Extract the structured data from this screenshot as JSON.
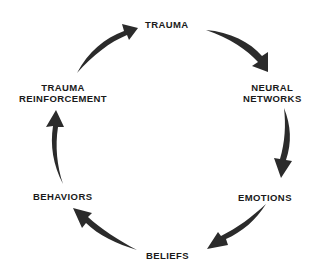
{
  "diagram": {
    "type": "cycle",
    "direction": "clockwise",
    "nodes": [
      {
        "id": "trauma",
        "lines": [
          "TRAUMA"
        ]
      },
      {
        "id": "neural_networks",
        "lines": [
          "NEURAL",
          "NETWORKS"
        ]
      },
      {
        "id": "emotions",
        "lines": [
          "EMOTIONS"
        ]
      },
      {
        "id": "beliefs",
        "lines": [
          "BELIEFS"
        ]
      },
      {
        "id": "behaviors",
        "lines": [
          "BEHAVIORS"
        ]
      },
      {
        "id": "trauma_reinforcement",
        "lines": [
          "TRAUMA",
          "REINFORCEMENT"
        ]
      }
    ],
    "edges": [
      {
        "from": "trauma",
        "to": "neural_networks"
      },
      {
        "from": "neural_networks",
        "to": "emotions"
      },
      {
        "from": "emotions",
        "to": "beliefs"
      },
      {
        "from": "beliefs",
        "to": "behaviors"
      },
      {
        "from": "behaviors",
        "to": "trauma_reinforcement"
      },
      {
        "from": "trauma_reinforcement",
        "to": "trauma"
      }
    ],
    "colors": {
      "arrow": "#2b2b2b",
      "text": "#1a1a1a",
      "background": "#ffffff"
    }
  }
}
